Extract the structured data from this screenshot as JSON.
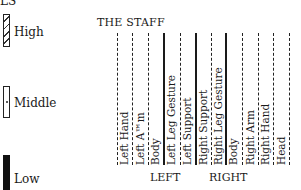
{
  "legend": {
    "heading_fragment": "LS",
    "items": [
      {
        "label": "High",
        "pattern": "hatched"
      },
      {
        "label": "Middle",
        "pattern": "dot"
      },
      {
        "label": "Low",
        "pattern": "solid-black"
      }
    ]
  },
  "staff": {
    "title": "THE STAFF",
    "columns": [
      {
        "label": "Left Hand",
        "line": "dashed"
      },
      {
        "label": "Left A™m",
        "line": "dashed"
      },
      {
        "label": "Body",
        "line": "dashed"
      },
      {
        "label": "Left Leg Gesture",
        "line": "solid"
      },
      {
        "label": "Left Support",
        "line": "dashed"
      },
      {
        "label": "Right Support",
        "line": "solid"
      },
      {
        "label": "Right Leg Gesture",
        "line": "dashed"
      },
      {
        "label": "Body",
        "line": "solid"
      },
      {
        "label": "Right Arm",
        "line": "dashed"
      },
      {
        "label": "Right Hand",
        "line": "dashed"
      },
      {
        "label": "Head",
        "line": "dashed"
      },
      {
        "label": "",
        "line": "dashed"
      }
    ],
    "side_labels": {
      "left": "LEFT",
      "right": "RIGHT"
    }
  },
  "colors": {
    "ink": "#1a1a1a",
    "background": "#ffffff"
  }
}
